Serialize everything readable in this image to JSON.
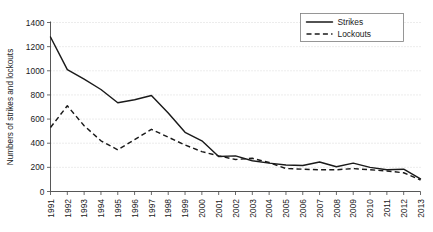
{
  "chart_data": {
    "type": "line",
    "title": "",
    "xlabel": "",
    "ylabel": "Numbers of strikes and lockouts",
    "ylim": [
      0,
      1400
    ],
    "ytick_step": 200,
    "yticks": [
      "0",
      "200",
      "400",
      "600",
      "800",
      "1000",
      "1200",
      "1400"
    ],
    "grid": true,
    "legend_position": "top-right",
    "categories": [
      "1991",
      "1992",
      "1993",
      "1994",
      "1995",
      "1996",
      "1997",
      "1998",
      "1999",
      "2000",
      "2001",
      "2002",
      "2003",
      "2004",
      "2005",
      "2006",
      "2007",
      "2008",
      "2009",
      "2010",
      "2011",
      "2012",
      "2013"
    ],
    "series": [
      {
        "name": "Strikes",
        "style": "solid",
        "color": "#1a1a1a",
        "values": [
          1280,
          1010,
          930,
          845,
          735,
          760,
          795,
          650,
          490,
          420,
          290,
          295,
          255,
          235,
          220,
          215,
          245,
          205,
          235,
          200,
          180,
          185,
          105
        ]
      },
      {
        "name": "Lockouts",
        "style": "dashed",
        "color": "#1a1a1a",
        "values": [
          530,
          710,
          545,
          420,
          345,
          430,
          515,
          450,
          385,
          330,
          295,
          265,
          275,
          240,
          190,
          185,
          180,
          180,
          190,
          180,
          170,
          155,
          95
        ]
      }
    ]
  },
  "legend": {
    "entries": [
      {
        "label": "Strikes"
      },
      {
        "label": "Lockouts"
      }
    ]
  },
  "axes": {
    "y_title": "Numbers of strikes and lockouts"
  }
}
